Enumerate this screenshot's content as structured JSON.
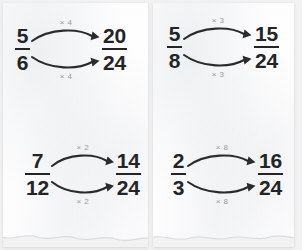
{
  "worksheet": {
    "title": "Equivalent Fractions",
    "sheets": [
      {
        "name": "left-sheet",
        "problems": [
          {
            "id": "top-left",
            "source": {
              "numerator": "5",
              "denominator": "6"
            },
            "result": {
              "numerator": "20",
              "denominator": "24"
            },
            "top_label": "× 4",
            "bottom_label": "× 4",
            "arrow_top": "arrow-right-curved",
            "arrow_bottom": "arrow-right-curved"
          },
          {
            "id": "bottom-left",
            "source": {
              "numerator": "7",
              "denominator": "12"
            },
            "result": {
              "numerator": "14",
              "denominator": "24"
            },
            "top_label": "× 2",
            "bottom_label": "× 2",
            "arrow_top": "arrow-right-curved",
            "arrow_bottom": "arrow-right-curved"
          }
        ]
      },
      {
        "name": "right-sheet",
        "problems": [
          {
            "id": "top-right",
            "source": {
              "numerator": "5",
              "denominator": "8"
            },
            "result": {
              "numerator": "15",
              "denominator": "24"
            },
            "top_label": "× 3",
            "bottom_label": "× 3",
            "arrow_top": "arrow-right-curved",
            "arrow_bottom": "arrow-right-curved"
          },
          {
            "id": "bottom-right",
            "source": {
              "numerator": "2",
              "denominator": "3"
            },
            "result": {
              "numerator": "16",
              "denominator": "24"
            },
            "top_label": "× 8",
            "bottom_label": "× 8",
            "arrow_top": "arrow-right-curved",
            "arrow_bottom": "arrow-right-curved"
          }
        ]
      }
    ],
    "colors": {
      "digit": "#242427",
      "label": "#9a9a9f",
      "arrow": "#2b2b2e",
      "paper": "#fefefe",
      "background": "#f2f2f3"
    }
  }
}
